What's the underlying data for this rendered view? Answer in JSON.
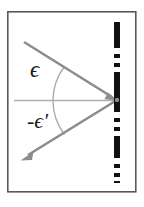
{
  "figure": {
    "background_color": "#ffffff",
    "frame": {
      "name": "figure-border",
      "x": 7,
      "y": 11,
      "width": 129,
      "height": 181,
      "stroke_color": "#595959",
      "stroke_width": 1.6
    },
    "labels": {
      "incidence_angle": "ϵ",
      "reflection_angle": "-ϵ'"
    },
    "colors": {
      "ray": "#8c8c8c",
      "axis": "#b0b0b0",
      "boundary": "#111111",
      "arc": "#a8a8a8",
      "label": "#1a1a1a",
      "frame": "#595959"
    },
    "elements": {
      "boundary_line": {
        "label": "boundary-surface",
        "style": "dash-dot-dot vertical",
        "x": 117,
        "y_top": 22,
        "y_bottom": 183,
        "stroke_width": 6
      },
      "normal_axis": {
        "label": "horizontal-normal-axis",
        "x_start": 14,
        "x_end": 117,
        "y": 100,
        "stroke_width": 1.6
      },
      "incident_ray": {
        "label": "incident-ray",
        "from_x": 24,
        "from_y": 42,
        "to_x": 117,
        "to_y": 100,
        "arrow_at": "end",
        "stroke_width": 2.6
      },
      "reflected_ray": {
        "label": "reflected-ray",
        "from_x": 117,
        "from_y": 100,
        "to_x": 22,
        "to_y": 159,
        "arrow_at": "end",
        "stroke_width": 2.6
      },
      "angle_arc": {
        "label": "angle-arc",
        "center_x": 117,
        "center_y": 100,
        "radius": 56,
        "stroke_width": 1.3
      },
      "vertex": {
        "label": "incidence-point",
        "x": 117,
        "y": 100
      }
    }
  }
}
